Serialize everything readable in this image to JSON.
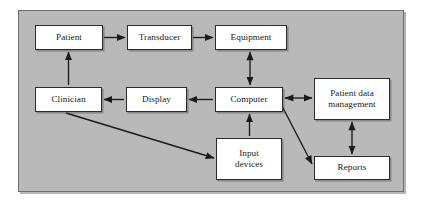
{
  "diagram": {
    "background_color": "#b9b9b9",
    "frame_border_color": "#6d6d6d",
    "node_fill_color": "#ffffff",
    "node_border_color": "#2b2b2b",
    "arrow_color": "#1a1a1a",
    "nodes": [
      {
        "id": "patient",
        "label": "Patient"
      },
      {
        "id": "transducer",
        "label": "Transducer"
      },
      {
        "id": "equipment",
        "label": "Equipment"
      },
      {
        "id": "clinician",
        "label": "Clinician"
      },
      {
        "id": "display",
        "label": "Display"
      },
      {
        "id": "computer",
        "label": "Computer"
      },
      {
        "id": "patient_data",
        "label": "Patient data",
        "label2": "management"
      },
      {
        "id": "input_devices",
        "label": "Input",
        "label2": "devices"
      },
      {
        "id": "reports",
        "label": "Reports"
      }
    ],
    "edges": [
      {
        "from": "patient",
        "to": "transducer",
        "direction": "one-way"
      },
      {
        "from": "transducer",
        "to": "equipment",
        "direction": "one-way"
      },
      {
        "from": "equipment",
        "to": "computer",
        "direction": "two-way"
      },
      {
        "from": "computer",
        "to": "display",
        "direction": "one-way"
      },
      {
        "from": "display",
        "to": "clinician",
        "direction": "one-way"
      },
      {
        "from": "clinician",
        "to": "patient",
        "direction": "one-way"
      },
      {
        "from": "clinician",
        "to": "input_devices",
        "direction": "one-way"
      },
      {
        "from": "input_devices",
        "to": "computer",
        "direction": "one-way"
      },
      {
        "from": "computer",
        "to": "patient_data",
        "direction": "two-way"
      },
      {
        "from": "computer",
        "to": "reports",
        "direction": "one-way"
      },
      {
        "from": "patient_data",
        "to": "reports",
        "direction": "two-way"
      }
    ]
  }
}
